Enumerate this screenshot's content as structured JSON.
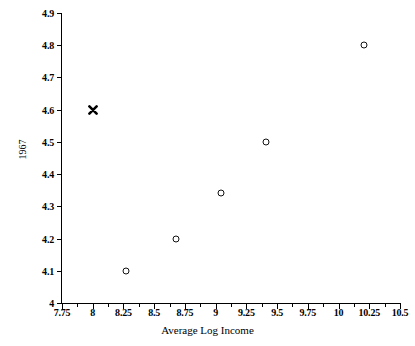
{
  "chart_data": {
    "type": "scatter",
    "title": "",
    "xlabel": "Average Log Income",
    "ylabel": "1967",
    "xlim": [
      7.75,
      10.5
    ],
    "ylim": [
      4,
      4.9
    ],
    "grid": false,
    "legend": null,
    "x_ticks": [
      "7.75",
      "8",
      "8.25",
      "8.5",
      "8.75",
      "9",
      "9.25",
      "9.5",
      "9.75",
      "10",
      "10.25",
      "10.5"
    ],
    "x_tick_values": [
      7.75,
      8,
      8.25,
      8.5,
      8.75,
      9,
      9.25,
      9.5,
      9.75,
      10,
      10.25,
      10.5
    ],
    "y_ticks": [
      "4",
      "4.1",
      "4.2",
      "4.3",
      "4.4",
      "4.5",
      "4.6",
      "4.7",
      "4.8",
      "4.9"
    ],
    "y_tick_values": [
      4,
      4.1,
      4.2,
      4.3,
      4.4,
      4.5,
      4.6,
      4.7,
      4.8,
      4.9
    ],
    "points": [
      {
        "x": 8.0,
        "y": 4.6,
        "marker": "x"
      },
      {
        "x": 8.27,
        "y": 4.1,
        "marker": "circle"
      },
      {
        "x": 8.68,
        "y": 4.2,
        "marker": "circle"
      },
      {
        "x": 9.04,
        "y": 4.34,
        "marker": "circle"
      },
      {
        "x": 9.41,
        "y": 4.5,
        "marker": "circle"
      },
      {
        "x": 10.21,
        "y": 4.8,
        "marker": "circle"
      }
    ]
  }
}
